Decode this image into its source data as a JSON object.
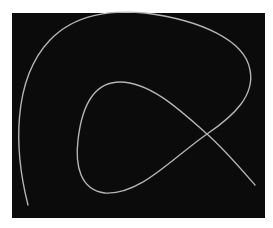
{
  "figure": {
    "colors": {
      "page_background": "#ffffff",
      "panel_background": "#0b0b0b",
      "curve_stroke": "#b4b4b4"
    },
    "panel": {
      "x": 12,
      "y": 13,
      "width": 253,
      "height": 205
    },
    "curve": {
      "stroke_width": 1.4,
      "path": "M 28 205 C 14 150, 12 80, 50 40 C 75 14, 110 10, 145 13 C 200 20, 245 40, 250 70 C 255 95, 235 115, 207 134 C 170 160, 140 195, 105 193 C 80 190, 75 165, 78 140 C 82 105, 95 82, 120 82 C 150 82, 180 110, 207 134 C 225 150, 242 170, 255 185"
    },
    "key_points": {
      "start": [
        28,
        205
      ],
      "top_left_arc": [
        50,
        40
      ],
      "top_edge": [
        145,
        13
      ],
      "rightmost": [
        250,
        70
      ],
      "crossing": [
        207,
        134
      ],
      "inner_bottom": [
        105,
        193
      ],
      "inner_left": [
        78,
        140
      ],
      "inner_top": [
        120,
        82
      ],
      "end": [
        255,
        185
      ]
    }
  }
}
